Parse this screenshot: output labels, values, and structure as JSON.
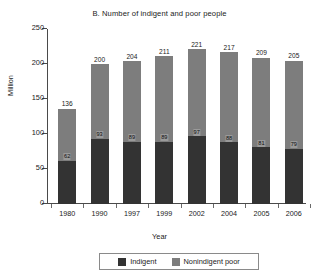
{
  "chart_data": {
    "type": "bar",
    "stacked": true,
    "title": "B. Number of indigent and poor people",
    "xlabel": "Year",
    "ylabel": "Million",
    "categories": [
      "1980",
      "1990",
      "1997",
      "1999",
      "2002",
      "2004",
      "2005",
      "2006"
    ],
    "series": [
      {
        "name": "Indigent",
        "color": "#333333",
        "values": [
          62,
          93,
          89,
          89,
          97,
          88,
          81,
          79
        ]
      },
      {
        "name": "Nonindigent poor",
        "color": "#7d7d7d",
        "values": [
          74,
          107,
          115,
          122,
          124,
          129,
          128,
          126
        ]
      }
    ],
    "totals": [
      136,
      200,
      204,
      211,
      221,
      217,
      209,
      205
    ],
    "ylim": [
      0,
      250
    ],
    "yticks": [
      0,
      50,
      100,
      150,
      200,
      250
    ],
    "ytick_labels": [
      "0",
      "50",
      "100",
      "150",
      "200",
      "250"
    ],
    "grid": false,
    "legend_position": "bottom",
    "legend": [
      "Indigent",
      "Nonindigent poor"
    ]
  },
  "legend": {
    "indigent_label": "Indigent",
    "nonindigent_label": "Nonindigent poor"
  }
}
